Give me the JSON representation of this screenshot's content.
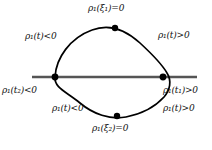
{
  "figure": {
    "kind": "mathematical-curve-diagram",
    "colors": {
      "curve": "#000000",
      "axis": "#555555",
      "node": "#000000",
      "background": "#ffffff",
      "text": "#111111"
    },
    "axis": {
      "x_start": 32,
      "x_end": 197,
      "y": 77,
      "stroke_width": 2.4
    },
    "points": [
      {
        "name": "left-node",
        "x": 55,
        "y": 77,
        "radius": 3.4,
        "label_ref": "labels.left_axis"
      },
      {
        "name": "right-node",
        "x": 163,
        "y": 77,
        "radius": 3.4,
        "label_ref": "labels.right_axis_1"
      },
      {
        "name": "top-point",
        "x": 115,
        "y": 28,
        "radius": 3.2,
        "label_ref": "labels.top"
      },
      {
        "name": "bottom-point",
        "x": 117,
        "y": 116,
        "radius": 3.2,
        "label_ref": "labels.bottom"
      }
    ],
    "curve_path": "M 55 77 C 57 56 74 35 97 29 C 112 25 128 32 140 43 C 152 54 162 65 167 73 C 172 81 171 90 165 97 C 157 106 143 114 128 117 C 112 120 95 115 82 104 C 68 92 54 88 55 77 Z"
  },
  "labels": {
    "top": {
      "rho": "ρ",
      "sub": "1",
      "arg_open": "(",
      "arg": "ξ",
      "arg_sub": "1",
      "arg_close": ")",
      "rel": "=0",
      "text": "ρ₁(ξ₁)=0"
    },
    "upper_left": {
      "rho": "ρ",
      "sub": "1",
      "arg_open": "(",
      "arg": "t",
      "arg_sub": "",
      "arg_close": ")",
      "rel": "<0",
      "text": "ρ₁(t)<0"
    },
    "upper_right": {
      "rho": "ρ",
      "sub": "1",
      "arg_open": "(",
      "arg": "t",
      "arg_sub": "",
      "arg_close": ")",
      "rel": ">0",
      "text": "ρ₁(t)>0"
    },
    "left_axis": {
      "rho": "ρ",
      "sub": "1",
      "arg_open": "(",
      "arg": "t",
      "arg_sub": "2",
      "arg_close": ")",
      "rel": "<0",
      "text": "ρ₁(t₂)<0"
    },
    "lower_left": {
      "rho": "ρ",
      "sub": "1",
      "arg_open": "(",
      "arg": "t",
      "arg_sub": "",
      "arg_close": ")",
      "rel": "<0",
      "text": "ρ₁(t)<0"
    },
    "right_axis_1": {
      "rho": "ρ",
      "sub": "1",
      "arg_open": "(",
      "arg": "t",
      "arg_sub": "1",
      "arg_close": ")",
      "rel": ">0",
      "text": "ρ₁(t₁)>0"
    },
    "right_axis_2": {
      "rho": "ρ",
      "sub": "1",
      "arg_open": "(",
      "arg": "t",
      "arg_sub": "",
      "arg_close": ")",
      "rel": ">0",
      "text": "ρ₁(t)>0"
    },
    "bottom": {
      "rho": "ρ",
      "sub": "1",
      "arg_open": "(",
      "arg": "ξ",
      "arg_sub": "2",
      "arg_close": ")",
      "rel": "=0",
      "text": "ρ₁(ξ₂)=0"
    }
  }
}
